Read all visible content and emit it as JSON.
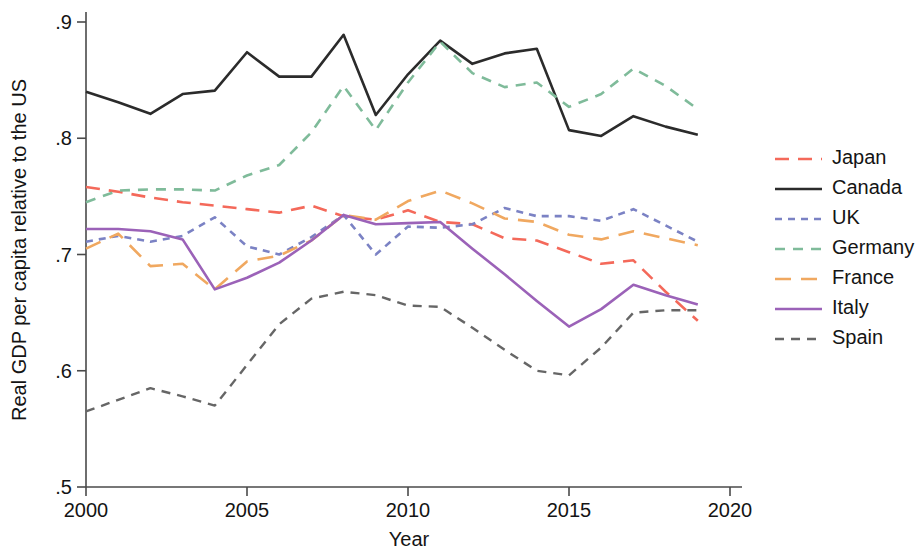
{
  "chart_data": {
    "type": "line",
    "title": "",
    "xlabel": "Year",
    "ylabel": "Real GDP per capita relative to the US",
    "xlim": [
      2000,
      2020
    ],
    "ylim": [
      0.5,
      0.9
    ],
    "grid": false,
    "legend_position": "right",
    "xticks": [
      "2000",
      "2005",
      "2010",
      "2015",
      "2020"
    ],
    "xtick_values": [
      2000,
      2005,
      2010,
      2015,
      2020
    ],
    "yticks": [
      ".9",
      ".8",
      ".7",
      ".6",
      ".5"
    ],
    "ytick_values": [
      0.9,
      0.8,
      0.7,
      0.6,
      0.5
    ],
    "x": [
      2000,
      2001,
      2002,
      2003,
      2004,
      2005,
      2006,
      2007,
      2008,
      2009,
      2010,
      2011,
      2012,
      2013,
      2014,
      2015,
      2016,
      2017,
      2018,
      2019
    ],
    "series": [
      {
        "name": "Japan",
        "color": "#f4695a",
        "dash": "14,9",
        "width": 2.6,
        "values": [
          0.758,
          0.754,
          0.749,
          0.745,
          0.742,
          0.739,
          0.736,
          0.742,
          0.733,
          0.73,
          0.738,
          0.728,
          0.726,
          0.714,
          0.712,
          0.702,
          0.692,
          0.695,
          0.668,
          0.643
        ]
      },
      {
        "name": "Canada",
        "color": "#2b2b2b",
        "dash": "none",
        "width": 2.6,
        "values": [
          0.84,
          0.831,
          0.821,
          0.838,
          0.841,
          0.874,
          0.853,
          0.853,
          0.889,
          0.82,
          0.855,
          0.884,
          0.864,
          0.873,
          0.877,
          0.807,
          0.802,
          0.819,
          0.81,
          0.803
        ]
      },
      {
        "name": "UK",
        "color": "#7b82c4",
        "dash": "7,6",
        "width": 2.6,
        "values": [
          0.711,
          0.716,
          0.711,
          0.716,
          0.732,
          0.707,
          0.7,
          0.715,
          0.734,
          0.7,
          0.724,
          0.723,
          0.726,
          0.74,
          0.733,
          0.733,
          0.729,
          0.739,
          0.725,
          0.711
        ]
      },
      {
        "name": "Germany",
        "color": "#7fbb9a",
        "dash": "10,8",
        "width": 2.6,
        "values": [
          0.745,
          0.755,
          0.756,
          0.756,
          0.755,
          0.768,
          0.777,
          0.805,
          0.845,
          0.807,
          0.848,
          0.883,
          0.856,
          0.844,
          0.848,
          0.827,
          0.838,
          0.86,
          0.845,
          0.825
        ]
      },
      {
        "name": "France",
        "color": "#f0a860",
        "dash": "16,10",
        "width": 2.6,
        "values": [
          0.705,
          0.718,
          0.69,
          0.692,
          0.67,
          0.694,
          0.699,
          0.712,
          0.734,
          0.73,
          0.746,
          0.755,
          0.744,
          0.731,
          0.728,
          0.717,
          0.713,
          0.72,
          0.714,
          0.708
        ]
      },
      {
        "name": "Italy",
        "color": "#9b62b8",
        "dash": "none",
        "width": 2.6,
        "values": [
          0.722,
          0.722,
          0.72,
          0.713,
          0.67,
          0.68,
          0.693,
          0.712,
          0.734,
          0.726,
          0.727,
          0.728,
          0.705,
          0.683,
          0.66,
          0.638,
          0.653,
          0.674,
          0.665,
          0.657
        ]
      },
      {
        "name": "Spain",
        "color": "#666666",
        "dash": "9,7",
        "width": 2.4,
        "values": [
          0.565,
          0.575,
          0.585,
          0.578,
          0.57,
          0.605,
          0.64,
          0.662,
          0.668,
          0.665,
          0.656,
          0.655,
          0.637,
          0.618,
          0.6,
          0.596,
          0.62,
          0.65,
          0.652,
          0.652
        ]
      }
    ]
  },
  "legend": {
    "entries": [
      {
        "label": "Japan"
      },
      {
        "label": "Canada"
      },
      {
        "label": "UK"
      },
      {
        "label": "Germany"
      },
      {
        "label": "France"
      },
      {
        "label": "Italy"
      },
      {
        "label": "Spain"
      }
    ]
  }
}
